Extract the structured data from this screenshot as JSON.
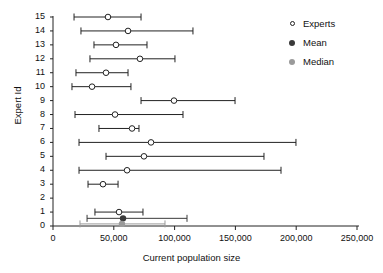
{
  "chart_data": {
    "type": "scatter",
    "title": "",
    "xlabel": "Current population size",
    "ylabel": "Expert Id",
    "xlim": [
      0,
      250000
    ],
    "ylim": [
      0,
      15
    ],
    "grid": false,
    "legend_position": "top-right",
    "xticks": [
      0,
      50000,
      100000,
      150000,
      200000,
      250000
    ],
    "xticklabels": [
      "0",
      "50,000",
      "100,000",
      "150,000",
      "200,000",
      "250,000"
    ],
    "yticks": [
      0,
      1,
      2,
      3,
      4,
      5,
      6,
      7,
      8,
      9,
      10,
      11,
      12,
      13,
      14,
      15
    ],
    "yticklabels": [
      "0",
      "1",
      "2",
      "3",
      "4",
      "5",
      "6",
      "7",
      "8",
      "9",
      "10",
      "11",
      "12",
      "13",
      "14",
      "15"
    ],
    "legend": [
      {
        "label": "Experts",
        "marker": "open-circle",
        "color": "#ffffff"
      },
      {
        "label": "Mean",
        "marker": "filled-circle",
        "color": "#3a3a3a"
      },
      {
        "label": "Median",
        "marker": "filled-circle",
        "color": "#9a9a9a"
      }
    ],
    "series": [
      {
        "name": "Experts",
        "marker": "open-circle",
        "color": "#222222",
        "points": [
          {
            "expert_id": 15,
            "low": 17300,
            "best": 45200,
            "high": 72400
          },
          {
            "expert_id": 14,
            "low": 23000,
            "best": 61700,
            "high": 115100
          },
          {
            "expert_id": 13,
            "low": 33700,
            "best": 51800,
            "high": 77300
          },
          {
            "expert_id": 12,
            "low": 30400,
            "best": 71500,
            "high": 100300
          },
          {
            "expert_id": 11,
            "low": 18900,
            "best": 43600,
            "high": 61700
          },
          {
            "expert_id": 10,
            "low": 15600,
            "best": 32100,
            "high": 64100
          },
          {
            "expert_id": 9,
            "low": 72400,
            "best": 99500,
            "high": 149700
          },
          {
            "expert_id": 8,
            "low": 18100,
            "best": 51000,
            "high": 106900
          },
          {
            "expert_id": 7,
            "low": 37800,
            "best": 65000,
            "high": 70700
          },
          {
            "expert_id": 6,
            "low": 21400,
            "best": 80600,
            "high": 199800
          },
          {
            "expert_id": 5,
            "low": 43600,
            "best": 74800,
            "high": 173500
          },
          {
            "expert_id": 4,
            "low": 21400,
            "best": 60900,
            "high": 187500
          },
          {
            "expert_id": 3,
            "low": 28800,
            "best": 41100,
            "high": 53500
          },
          {
            "expert_id": 1,
            "low": 34500,
            "best": 54300,
            "high": 74000
          }
        ]
      },
      {
        "name": "Mean",
        "marker": "filled-circle",
        "color": "#3a3a3a",
        "points": [
          {
            "expert_id": 0.55,
            "low": 28000,
            "best": 57600,
            "high": 110200
          }
        ]
      },
      {
        "name": "Median",
        "marker": "filled-circle",
        "color": "#9a9a9a",
        "points": [
          {
            "expert_id": 0.15,
            "low": 22200,
            "best": 56700,
            "high": 92100
          }
        ]
      }
    ]
  }
}
